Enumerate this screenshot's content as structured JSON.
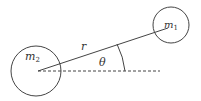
{
  "diagram": {
    "mass1": {
      "symbol": "m",
      "subscript": "1"
    },
    "mass2": {
      "symbol": "m",
      "subscript": "2"
    },
    "distance_label": "r",
    "angle_label": "θ"
  },
  "colors": {
    "stroke": "#444444",
    "text": "#333333"
  }
}
